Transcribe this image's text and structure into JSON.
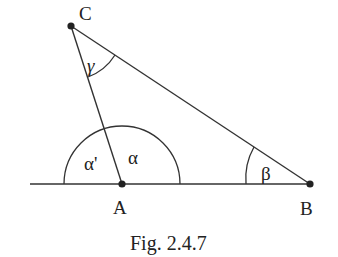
{
  "figure": {
    "caption": "Fig. 2.4.7",
    "points": {
      "A": {
        "label": "A"
      },
      "B": {
        "label": "B"
      },
      "C": {
        "label": "C"
      }
    },
    "angles": {
      "alpha": "α",
      "alpha_prime": "α'",
      "beta": "β",
      "gamma": "γ"
    }
  }
}
